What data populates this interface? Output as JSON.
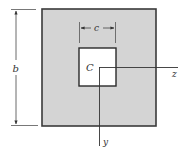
{
  "figure": {
    "type": "cross-section",
    "colors": {
      "fill": "#d4d4d4",
      "stroke": "#3a3a3a",
      "hole": "#ffffff",
      "line": "#444444"
    },
    "labels": {
      "outer_dimension": "b",
      "inner_dimension": "c",
      "centroid": "C",
      "z_axis": "z",
      "y_axis": "y"
    }
  }
}
